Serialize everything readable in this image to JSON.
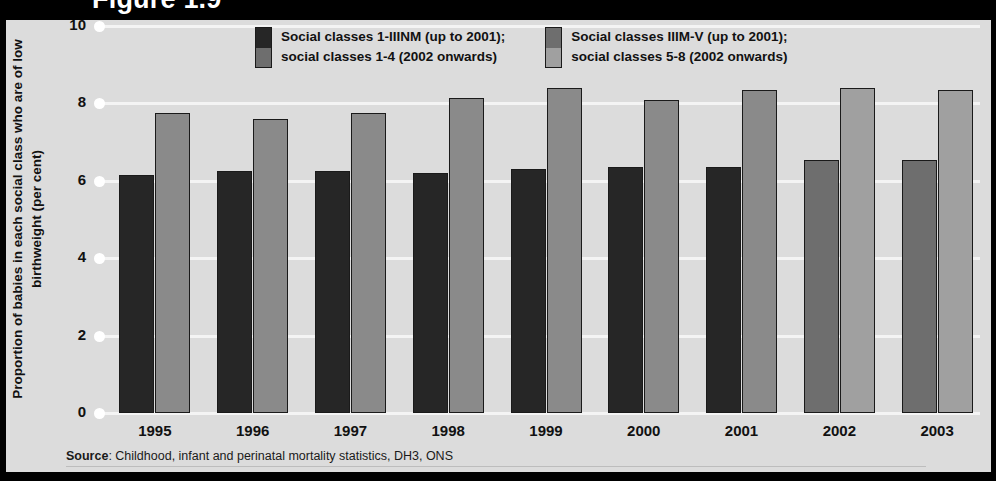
{
  "header": {
    "clipped_title": "Figure 1.9"
  },
  "legend": [
    {
      "name": "legend-item-1",
      "line1": "Social classes 1-IIINM (up to 2001);",
      "line2": "social classes 1-4 (2002 onwards)",
      "color_top": "#262626",
      "color_bottom": "#6e6e6e"
    },
    {
      "name": "legend-item-2",
      "line1": "Social classes IIIM-V (up to 2001);",
      "line2": "social classes 5-8 (2002 onwards)",
      "color_top": "#6e6e6e",
      "color_bottom": "#a0a0a0"
    }
  ],
  "axes": {
    "ylabel": "Proportion of babies in each social class who are of low birthweight (per cent)",
    "yticks": [
      "10",
      "8",
      "6",
      "4",
      "2",
      "0"
    ]
  },
  "source": {
    "prefix": "Source",
    "text": ": Childhood, infant and perinatal mortality statistics, DH3, ONS",
    "full": "Source: Childhood, infant and perinatal mortality statistics, DH3, ONS"
  },
  "chart_data": {
    "type": "bar",
    "title": "Figure 1.9",
    "xlabel": "",
    "ylabel": "Proportion of babies in each social class who are of low birthweight (per cent)",
    "ylim": [
      0,
      10
    ],
    "yticks": [
      0,
      2,
      4,
      6,
      8,
      10
    ],
    "grid": true,
    "legend_position": "top",
    "categories": [
      "1995",
      "1996",
      "1997",
      "1998",
      "1999",
      "2000",
      "2001",
      "2002",
      "2003"
    ],
    "series": [
      {
        "name": "Social classes 1-IIINM (up to 2001); social classes 1-4 (2002 onwards)",
        "values": [
          6.15,
          6.25,
          6.25,
          6.2,
          6.3,
          6.35,
          6.35,
          6.55,
          6.55
        ],
        "colors": [
          "#262626",
          "#262626",
          "#262626",
          "#262626",
          "#262626",
          "#262626",
          "#262626",
          "#6e6e6e",
          "#6e6e6e"
        ]
      },
      {
        "name": "Social classes IIIM-V (up to 2001); social classes 5-8 (2002 onwards)",
        "values": [
          7.75,
          7.6,
          7.75,
          8.15,
          8.4,
          8.1,
          8.35,
          8.4,
          8.35
        ],
        "colors": [
          "#8a8a8a",
          "#8a8a8a",
          "#8a8a8a",
          "#8a8a8a",
          "#8a8a8a",
          "#8a8a8a",
          "#8a8a8a",
          "#a0a0a0",
          "#a0a0a0"
        ]
      }
    ]
  }
}
